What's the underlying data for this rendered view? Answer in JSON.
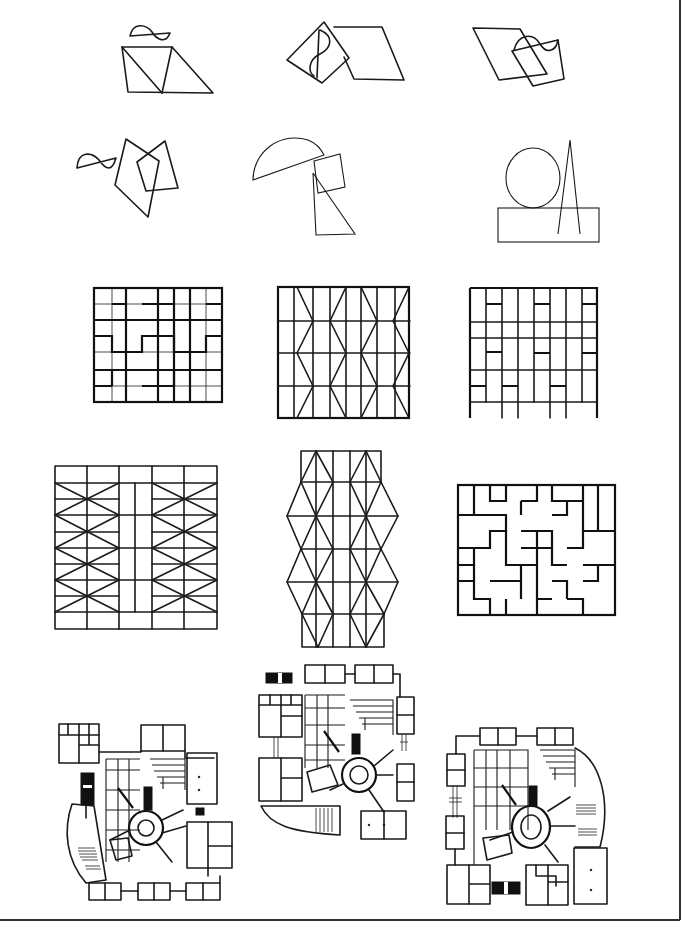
{
  "sheet": {
    "title": "Composition and tessellation studies",
    "background": "#ffffff",
    "ink": "#1a1a1a",
    "frame_color": "#333333"
  },
  "rows": [
    {
      "name": "row-1-overlapping-shapes",
      "panels": [
        {
          "id": "p1",
          "name": "sine-over-trapezoid-triangle"
        },
        {
          "id": "p2",
          "name": "rotated-square-with-s-curve-and-parallelogram"
        },
        {
          "id": "p3",
          "name": "parallelogram-with-wavy-quad"
        }
      ]
    },
    {
      "name": "row-2-overlapping-shapes",
      "panels": [
        {
          "id": "p4",
          "name": "sine-and-two-quads"
        },
        {
          "id": "p5",
          "name": "semicircle-square-triangle"
        },
        {
          "id": "p6",
          "name": "circle-triangle-rectangle"
        }
      ]
    },
    {
      "name": "row-3-grids",
      "panels": [
        {
          "id": "p7",
          "name": "h-pattern-grid"
        },
        {
          "id": "p8",
          "name": "chevron-grid"
        },
        {
          "id": "p9",
          "name": "irregular-block-grid"
        }
      ]
    },
    {
      "name": "row-4-grids",
      "panels": [
        {
          "id": "p10",
          "name": "x-braced-grid"
        },
        {
          "id": "p11",
          "name": "diamond-lattice-tower"
        },
        {
          "id": "p12",
          "name": "cross-tessellation"
        }
      ]
    },
    {
      "name": "row-5-plans",
      "panels": [
        {
          "id": "p13",
          "name": "site-plan-a"
        },
        {
          "id": "p14",
          "name": "site-plan-b"
        },
        {
          "id": "p15",
          "name": "site-plan-c"
        }
      ]
    }
  ]
}
